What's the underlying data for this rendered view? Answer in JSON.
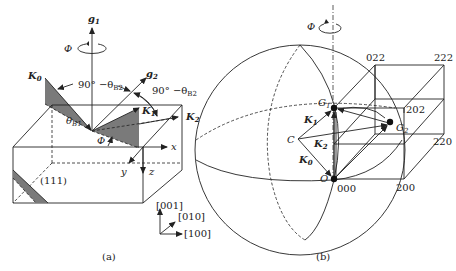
{
  "panel_a": {
    "caption": "(a)",
    "labels": {
      "g1": "g",
      "g1_sub": "1",
      "g2": "g",
      "g2_sub": "2",
      "phi": "Φ",
      "phi_small": "Φ",
      "k0": "K",
      "k0_sub": "0",
      "k1": "K",
      "k1_sub": "1",
      "k2": "K",
      "k2_sub": "2",
      "angle_left": "90° −θ",
      "angle_left_sub": "B2",
      "angle_right": "90° −θ",
      "angle_right_sub": "B2",
      "theta_b1": "θ",
      "theta_b1_sub": "B1",
      "x": "x",
      "y": "y",
      "z": "z",
      "plane": "(111)",
      "dir_001": "[001]",
      "dir_010": "[010]",
      "dir_100": "[100]"
    }
  },
  "panel_b": {
    "caption": "(b)",
    "labels": {
      "phi": "Φ",
      "g1": "G",
      "g1_sub": "1",
      "g2": "G",
      "g2_sub": "2",
      "c": "C",
      "o": "O",
      "k0": "K",
      "k0_sub": "0",
      "k1": "K",
      "k1_sub": "1",
      "k2": "K",
      "k2_sub": "2",
      "n000": "000",
      "n200": "200",
      "n220": "220",
      "n202": "202",
      "n022": "022",
      "n222": "222"
    }
  },
  "colors": {
    "line": "#222222",
    "shade": "#7a7a7a",
    "background": "#ffffff"
  }
}
